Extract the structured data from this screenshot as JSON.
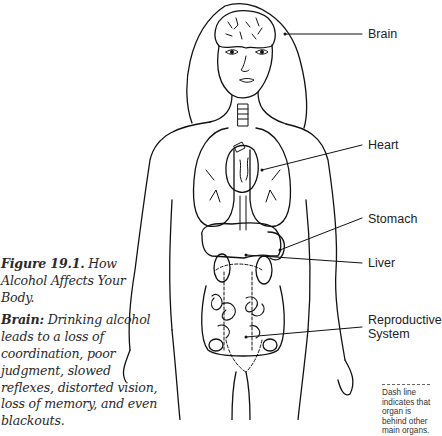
{
  "figure": {
    "number": "Figure 19.1.",
    "title": "How Alcohol Affects Your Body.",
    "description_term": "Brain:",
    "description_text": "Drinking alcohol leads to a loss of coordination, poor judgment, slowed reflexes, distorted vision, loss of memory, and even blackouts."
  },
  "labels": {
    "brain": "Brain",
    "heart": "Heart",
    "stomach": "Stomach",
    "liver": "Liver",
    "reproductive_line1": "Reproductive",
    "reproductive_line2": "System"
  },
  "legend": {
    "note": "Dash line indicates that organ is behind other main organs."
  },
  "colors": {
    "line": "#111111",
    "text": "#222222",
    "background": "#ffffff"
  }
}
